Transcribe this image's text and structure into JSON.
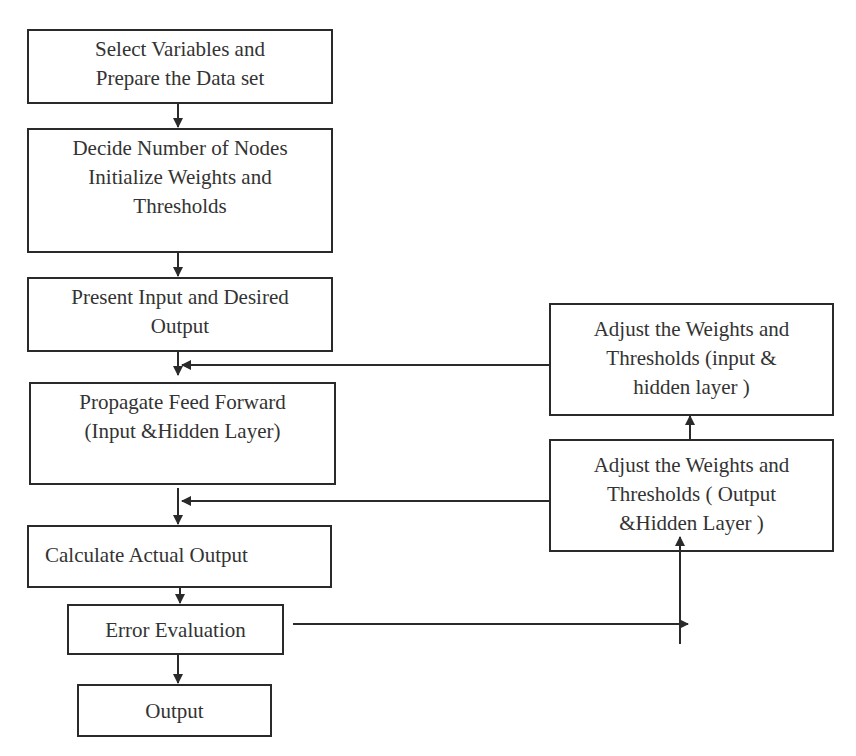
{
  "diagram": {
    "type": "flowchart",
    "colors": {
      "stroke": "#2a2a2a",
      "text": "#333333",
      "background": "#ffffff"
    },
    "main_flow": [
      {
        "id": "select",
        "lines": [
          "Select Variables and",
          "Prepare the Data set"
        ]
      },
      {
        "id": "decide",
        "lines": [
          "Decide Number of Nodes",
          "Initialize Weights and",
          "Thresholds"
        ]
      },
      {
        "id": "present",
        "lines": [
          "Present Input and Desired",
          "Output"
        ]
      },
      {
        "id": "propagate",
        "lines": [
          "Propagate Feed Forward",
          "(Input &Hidden Layer)"
        ]
      },
      {
        "id": "calculate",
        "lines": [
          "Calculate Actual Output"
        ]
      },
      {
        "id": "error",
        "lines": [
          "Error Evaluation"
        ]
      },
      {
        "id": "output",
        "lines": [
          "Output"
        ]
      }
    ],
    "feedback": [
      {
        "id": "adjust_input_hidden",
        "lines": [
          "Adjust the Weights and",
          "Thresholds (input &",
          "hidden layer )"
        ]
      },
      {
        "id": "adjust_output_hidden",
        "lines": [
          "Adjust the Weights and",
          "Thresholds ( Output",
          "&Hidden Layer )"
        ]
      }
    ],
    "edges": [
      {
        "from": "select",
        "to": "decide"
      },
      {
        "from": "decide",
        "to": "present"
      },
      {
        "from": "present",
        "to": "propagate"
      },
      {
        "from": "propagate",
        "to": "calculate"
      },
      {
        "from": "calculate",
        "to": "error"
      },
      {
        "from": "error",
        "to": "output"
      },
      {
        "from": "error",
        "to": "adjust_output_hidden"
      },
      {
        "from": "adjust_output_hidden",
        "to": "adjust_input_hidden"
      },
      {
        "from": "adjust_output_hidden",
        "to": "calculate",
        "note": "joins arrow between propagate and calculate"
      },
      {
        "from": "adjust_input_hidden",
        "to": "propagate",
        "note": "joins arrow between present and propagate"
      }
    ]
  }
}
